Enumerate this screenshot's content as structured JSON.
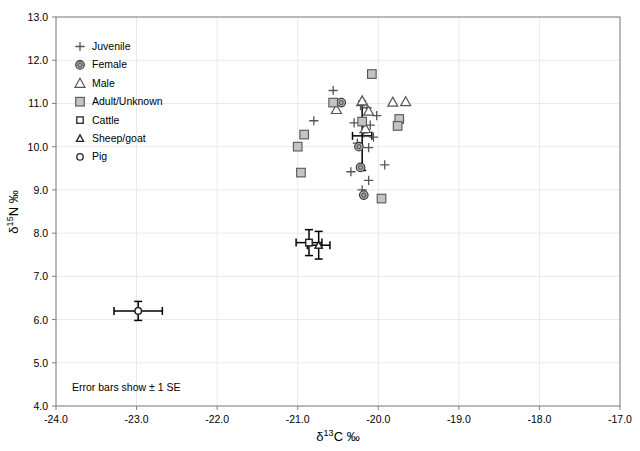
{
  "chart_data": {
    "type": "scatter",
    "title": "",
    "xlabel": "δ 13C ‰",
    "ylabel": "δ 15N ‰",
    "xlim": [
      -24.0,
      -17.0
    ],
    "ylim": [
      4.0,
      13.0
    ],
    "xticks": [
      "-24.0",
      "-23.0",
      "-22.0",
      "-21.0",
      "-20.0",
      "-19.0",
      "-18.0",
      "-17.0"
    ],
    "xtick_values": [
      -24.0,
      -23.0,
      -22.0,
      -21.0,
      -20.0,
      -19.0,
      -18.0,
      -17.0
    ],
    "yticks": [
      "4.0",
      "5.0",
      "6.0",
      "7.0",
      "8.0",
      "9.0",
      "10.0",
      "11.0",
      "12.0",
      "13.0"
    ],
    "ytick_values": [
      4.0,
      5.0,
      6.0,
      7.0,
      8.0,
      9.0,
      10.0,
      11.0,
      12.0,
      13.0
    ],
    "grid": true,
    "grid_color": "#e9e9e9",
    "legend_position": "top-left",
    "annotation": "Error bars show ± 1 SE",
    "legend": [
      {
        "key": "juvenile",
        "label": "Juvenile",
        "marker": "plus"
      },
      {
        "key": "female",
        "label": "Female",
        "marker": "filled-circle"
      },
      {
        "key": "male",
        "label": "Male",
        "marker": "open-triangle"
      },
      {
        "key": "adult_unknown",
        "label": "Adult/Unknown",
        "marker": "filled-square"
      },
      {
        "key": "cattle",
        "label": "Cattle",
        "marker": "small-open-square"
      },
      {
        "key": "sheep_goat",
        "label": "Sheep/goat",
        "marker": "small-open-triangle"
      },
      {
        "key": "pig",
        "label": "Pig",
        "marker": "small-open-circle"
      }
    ],
    "series": [
      {
        "name": "Juvenile",
        "marker": "plus",
        "points": [
          {
            "x": -20.56,
            "y": 11.3
          },
          {
            "x": -20.8,
            "y": 10.6
          },
          {
            "x": -20.22,
            "y": 10.95
          },
          {
            "x": -20.14,
            "y": 10.9
          },
          {
            "x": -20.3,
            "y": 10.55
          },
          {
            "x": -20.1,
            "y": 10.5
          },
          {
            "x": -20.18,
            "y": 10.32
          },
          {
            "x": -20.06,
            "y": 10.22
          },
          {
            "x": -20.26,
            "y": 10.08
          },
          {
            "x": -20.12,
            "y": 9.98
          },
          {
            "x": -19.92,
            "y": 9.58
          },
          {
            "x": -20.34,
            "y": 9.42
          },
          {
            "x": -20.12,
            "y": 9.22
          },
          {
            "x": -20.2,
            "y": 9.0
          },
          {
            "x": -20.02,
            "y": 10.72
          }
        ]
      },
      {
        "name": "Female",
        "marker": "filled-circle",
        "points": [
          {
            "x": -20.46,
            "y": 11.02
          },
          {
            "x": -20.24,
            "y": 10.0
          },
          {
            "x": -20.22,
            "y": 9.52
          },
          {
            "x": -20.18,
            "y": 8.88
          }
        ]
      },
      {
        "name": "Male",
        "marker": "open-triangle",
        "points": [
          {
            "x": -20.2,
            "y": 11.06
          },
          {
            "x": -20.52,
            "y": 10.86
          },
          {
            "x": -20.12,
            "y": 10.82
          },
          {
            "x": -20.16,
            "y": 10.42
          },
          {
            "x": -19.82,
            "y": 11.03
          },
          {
            "x": -19.66,
            "y": 11.04
          }
        ]
      },
      {
        "name": "Adult/Unknown",
        "marker": "filled-square",
        "points": [
          {
            "x": -20.08,
            "y": 11.68
          },
          {
            "x": -20.56,
            "y": 11.02
          },
          {
            "x": -20.2,
            "y": 10.58
          },
          {
            "x": -19.74,
            "y": 10.64
          },
          {
            "x": -20.92,
            "y": 10.28
          },
          {
            "x": -21.0,
            "y": 10.0
          },
          {
            "x": -20.96,
            "y": 9.4
          },
          {
            "x": -19.96,
            "y": 8.8
          },
          {
            "x": -19.76,
            "y": 10.48
          }
        ]
      },
      {
        "name": "Cattle",
        "marker": "small-open-square",
        "points": [
          {
            "x": -20.86,
            "y": 7.78
          }
        ]
      },
      {
        "name": "Sheep/goat",
        "marker": "small-open-triangle",
        "points": [
          {
            "x": -20.74,
            "y": 7.72
          }
        ]
      },
      {
        "name": "Pig",
        "marker": "small-open-circle",
        "points": [
          {
            "x": -22.98,
            "y": 6.2
          }
        ]
      }
    ],
    "error_bars": [
      {
        "series": "Cattle",
        "x": -20.86,
        "y": 7.78,
        "xerr": 0.16,
        "yerr": 0.3
      },
      {
        "series": "Sheep/goat",
        "x": -20.74,
        "y": 7.72,
        "xerr": 0.14,
        "yerr": 0.32
      },
      {
        "series": "Pig",
        "x": -22.98,
        "y": 6.2,
        "xerr": 0.3,
        "yerr": 0.22
      },
      {
        "series": "Human mean",
        "x": -20.2,
        "y": 10.25,
        "xerr": 0.12,
        "yerr": 0.8
      }
    ],
    "colors": {
      "marker_fill_female": "#a8a8a8",
      "marker_fill_adult": "#c4c4c4",
      "marker_stroke": "#555555",
      "error_bar": "#000000",
      "frame": "#808080",
      "grid": "#e9e9e9"
    }
  }
}
